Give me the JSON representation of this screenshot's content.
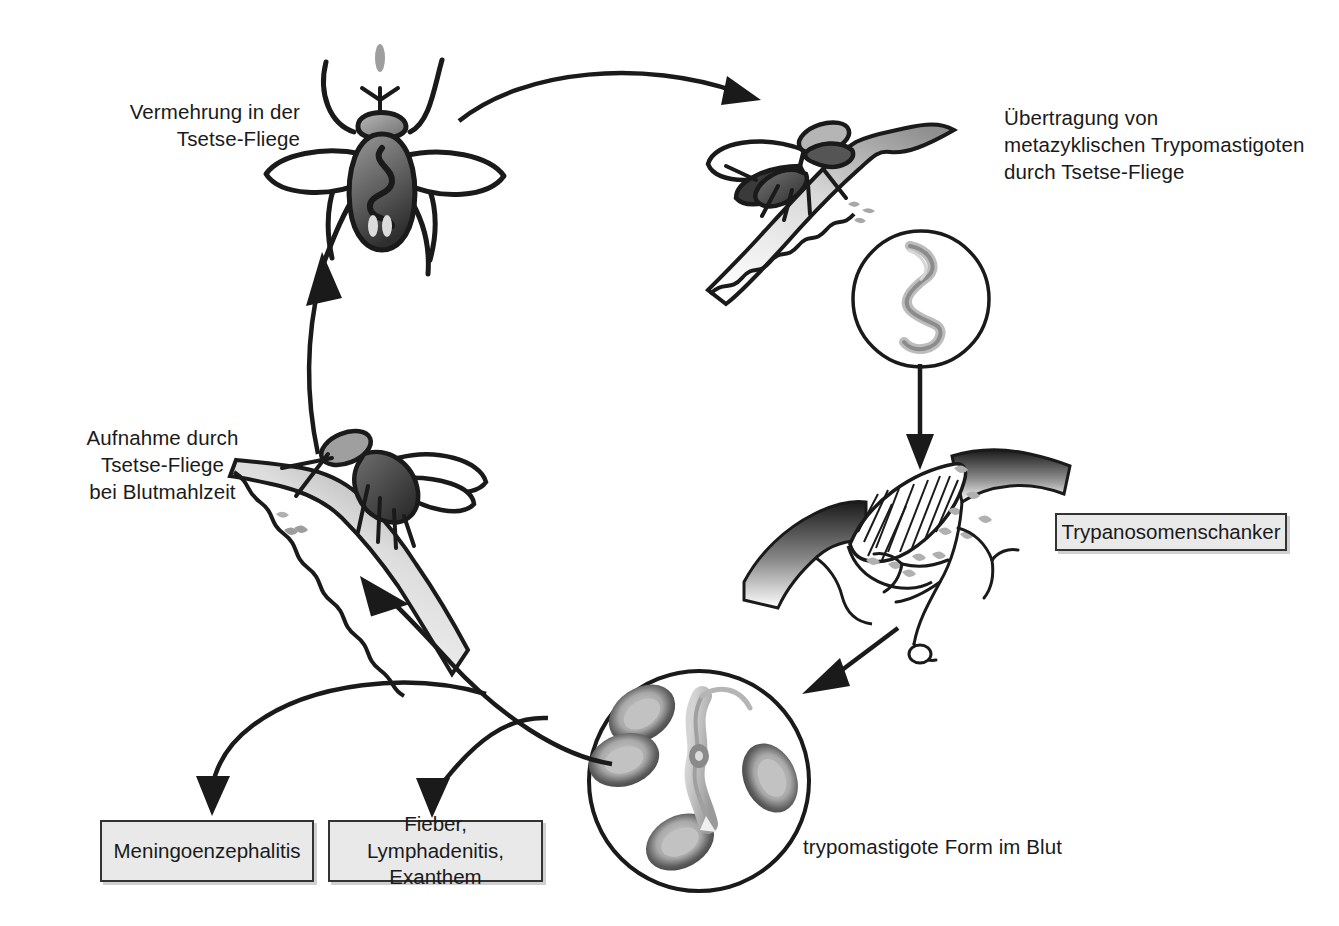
{
  "diagram": {
    "background_color": "#ffffff",
    "ink_color": "#1a1a1a",
    "box_fill": "#e9e9e9",
    "box_border": "#333333"
  },
  "labels": {
    "multiplication_in_fly": "Vermehrung in der\nTsetse-Fliege",
    "transmission": "Übertragung von\nmetazyklischen Trypomastigoten\ndurch Tsetse-Fliege",
    "uptake_by_fly": "Aufnahme durch\nTsetse-Fliege\nbei Blutmahlzeit",
    "blood_form": "trypomastigote Form im Blut"
  },
  "boxes": {
    "chancre": "Trypanosomenschanker",
    "meningoencephalitis": "Meningoenzephalitis",
    "fever_lymphadenitis": "Fieber, Lymphadenitis,\nExanthem"
  },
  "figures": {
    "fly_top_view": "tsetse-fly-dorsal-illustration",
    "fly_biting_upper": "tsetse-fly-biting-skin-illustration",
    "fly_biting_lower": "tsetse-fly-bloodmeal-illustration",
    "parasite_magnifier": "metacyclic-trypomastigote-circle-illustration",
    "skin_chancre": "skin-chancre-cross-section-illustration",
    "blood_smear": "blood-smear-trypomastigote-circle-illustration"
  },
  "arrows": {
    "top_curve": "arrow-fly-to-biting-fly",
    "transmission_down": "arrow-parasite-to-chancre",
    "chancre_to_blood": "arrow-chancre-to-blood",
    "blood_to_symptoms_left": "arrow-to-meningoencephalitis",
    "blood_to_symptoms_right": "arrow-to-fever-lymphadenitis",
    "uptake_up": "arrow-bloodmeal-to-fly-multiplication",
    "blood_to_skin": "arrow-blood-to-bloodmeal-skin"
  }
}
